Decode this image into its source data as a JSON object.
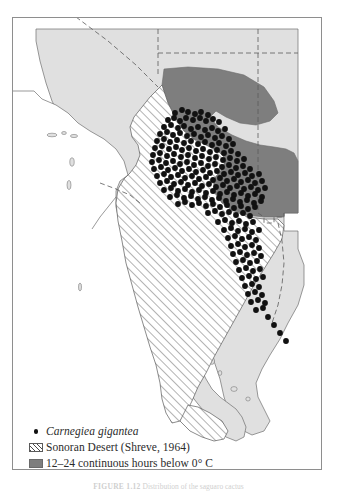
{
  "figure": {
    "caption_label": "FIGURE 1.12",
    "caption_text": "Distribution of the saguaro cactus"
  },
  "legend": {
    "items": [
      {
        "swatch": "dot-marker",
        "label": "Carnegiea gigantea",
        "style": "italic"
      },
      {
        "swatch": "hatched-box",
        "label": "Sonoran Desert (Shreve, 1964)",
        "style": "normal"
      },
      {
        "swatch": "solid-gray-box",
        "label": "12–24 continuous hours below 0° C",
        "style": "normal"
      }
    ]
  },
  "map": {
    "colors": {
      "land": "#e0e0e0",
      "land_outline": "#6f6f6f",
      "ocean": "#ffffff",
      "cold_region": "#7e7e7e",
      "cold_region_outline": "#6a6a6a",
      "hatch_line": "#4a4a4a",
      "dot": "#111111",
      "border_dashed": "#5a5a5a",
      "frame": "#8e8e8e"
    },
    "layers": [
      {
        "name": "land-mass",
        "description": "Southwestern United States and northwestern Mexico landmass including Baja California peninsula"
      },
      {
        "name": "sonoran-desert-extent",
        "description": "Diagonally hatched region after Shreve 1964"
      },
      {
        "name": "cold-hours-region",
        "description": "Solid gray region of 12-24 continuous hours below 0 degrees C"
      },
      {
        "name": "state-boundaries",
        "description": "Dashed political boundary lines"
      },
      {
        "name": "saguaro-occurrence-points",
        "description": "Black point records of Carnegiea gigantea"
      }
    ],
    "dot_radius": 2.9,
    "dot_count": 196,
    "dots": [
      [
        163,
        96
      ],
      [
        170,
        93
      ],
      [
        176,
        95
      ],
      [
        183,
        97
      ],
      [
        189,
        95
      ],
      [
        196,
        98
      ],
      [
        156,
        103
      ],
      [
        162,
        101
      ],
      [
        168,
        104
      ],
      [
        174,
        101
      ],
      [
        181,
        103
      ],
      [
        188,
        101
      ],
      [
        194,
        104
      ],
      [
        201,
        102
      ],
      [
        207,
        105
      ],
      [
        152,
        110
      ],
      [
        159,
        108
      ],
      [
        166,
        111
      ],
      [
        172,
        109
      ],
      [
        179,
        112
      ],
      [
        186,
        110
      ],
      [
        193,
        113
      ],
      [
        200,
        111
      ],
      [
        206,
        114
      ],
      [
        213,
        112
      ],
      [
        148,
        117
      ],
      [
        155,
        115
      ],
      [
        161,
        118
      ],
      [
        168,
        116
      ],
      [
        175,
        119
      ],
      [
        182,
        117
      ],
      [
        189,
        120
      ],
      [
        196,
        118
      ],
      [
        203,
        121
      ],
      [
        210,
        119
      ],
      [
        217,
        122
      ],
      [
        145,
        124
      ],
      [
        152,
        122
      ],
      [
        158,
        125
      ],
      [
        165,
        123
      ],
      [
        172,
        126
      ],
      [
        179,
        124
      ],
      [
        186,
        127
      ],
      [
        193,
        125
      ],
      [
        200,
        128
      ],
      [
        207,
        126
      ],
      [
        214,
        129
      ],
      [
        221,
        127
      ],
      [
        143,
        131
      ],
      [
        150,
        129
      ],
      [
        157,
        132
      ],
      [
        164,
        130
      ],
      [
        170,
        133
      ],
      [
        177,
        131
      ],
      [
        184,
        134
      ],
      [
        191,
        132
      ],
      [
        198,
        135
      ],
      [
        205,
        133
      ],
      [
        212,
        136
      ],
      [
        219,
        134
      ],
      [
        226,
        137
      ],
      [
        141,
        138
      ],
      [
        148,
        136
      ],
      [
        155,
        139
      ],
      [
        162,
        137
      ],
      [
        169,
        140
      ],
      [
        176,
        138
      ],
      [
        183,
        141
      ],
      [
        190,
        139
      ],
      [
        197,
        142
      ],
      [
        204,
        140
      ],
      [
        211,
        143
      ],
      [
        218,
        141
      ],
      [
        225,
        144
      ],
      [
        232,
        142
      ],
      [
        140,
        145
      ],
      [
        147,
        143
      ],
      [
        154,
        146
      ],
      [
        161,
        144
      ],
      [
        168,
        147
      ],
      [
        175,
        145
      ],
      [
        182,
        148
      ],
      [
        189,
        146
      ],
      [
        196,
        149
      ],
      [
        203,
        147
      ],
      [
        210,
        150
      ],
      [
        217,
        148
      ],
      [
        224,
        151
      ],
      [
        231,
        149
      ],
      [
        238,
        152
      ],
      [
        142,
        152
      ],
      [
        149,
        150
      ],
      [
        156,
        153
      ],
      [
        163,
        151
      ],
      [
        170,
        154
      ],
      [
        177,
        152
      ],
      [
        184,
        155
      ],
      [
        191,
        153
      ],
      [
        198,
        156
      ],
      [
        205,
        154
      ],
      [
        212,
        157
      ],
      [
        219,
        155
      ],
      [
        226,
        158
      ],
      [
        233,
        156
      ],
      [
        240,
        159
      ],
      [
        247,
        157
      ],
      [
        145,
        159
      ],
      [
        152,
        157
      ],
      [
        159,
        160
      ],
      [
        166,
        158
      ],
      [
        173,
        161
      ],
      [
        180,
        159
      ],
      [
        187,
        162
      ],
      [
        194,
        160
      ],
      [
        201,
        163
      ],
      [
        208,
        161
      ],
      [
        215,
        164
      ],
      [
        222,
        162
      ],
      [
        229,
        165
      ],
      [
        236,
        163
      ],
      [
        243,
        166
      ],
      [
        250,
        164
      ],
      [
        148,
        166
      ],
      [
        155,
        164
      ],
      [
        162,
        167
      ],
      [
        169,
        165
      ],
      [
        176,
        168
      ],
      [
        183,
        166
      ],
      [
        190,
        169
      ],
      [
        197,
        167
      ],
      [
        204,
        170
      ],
      [
        211,
        168
      ],
      [
        218,
        171
      ],
      [
        225,
        169
      ],
      [
        232,
        172
      ],
      [
        239,
        170
      ],
      [
        246,
        173
      ],
      [
        253,
        171
      ],
      [
        152,
        173
      ],
      [
        159,
        171
      ],
      [
        166,
        174
      ],
      [
        173,
        172
      ],
      [
        180,
        175
      ],
      [
        187,
        173
      ],
      [
        194,
        176
      ],
      [
        201,
        174
      ],
      [
        208,
        177
      ],
      [
        215,
        175
      ],
      [
        222,
        178
      ],
      [
        229,
        176
      ],
      [
        236,
        179
      ],
      [
        243,
        177
      ],
      [
        250,
        180
      ],
      [
        158,
        180
      ],
      [
        165,
        178
      ],
      [
        172,
        181
      ],
      [
        179,
        179
      ],
      [
        186,
        182
      ],
      [
        193,
        180
      ],
      [
        200,
        183
      ],
      [
        207,
        181
      ],
      [
        214,
        184
      ],
      [
        221,
        182
      ],
      [
        228,
        185
      ],
      [
        235,
        183
      ],
      [
        242,
        186
      ],
      [
        249,
        184
      ],
      [
        166,
        187
      ],
      [
        173,
        185
      ],
      [
        180,
        188
      ],
      [
        187,
        186
      ],
      [
        194,
        189
      ],
      [
        201,
        187
      ],
      [
        208,
        190
      ],
      [
        215,
        188
      ],
      [
        222,
        191
      ],
      [
        229,
        189
      ],
      [
        236,
        192
      ],
      [
        243,
        190
      ],
      [
        196,
        196
      ],
      [
        203,
        194
      ],
      [
        210,
        197
      ],
      [
        217,
        195
      ],
      [
        224,
        198
      ],
      [
        231,
        196
      ],
      [
        238,
        199
      ],
      [
        206,
        205
      ],
      [
        213,
        203
      ],
      [
        220,
        206
      ],
      [
        227,
        204
      ],
      [
        234,
        207
      ],
      [
        241,
        205
      ],
      [
        212,
        213
      ],
      [
        219,
        211
      ],
      [
        226,
        214
      ],
      [
        233,
        212
      ],
      [
        240,
        215
      ],
      [
        247,
        213
      ],
      [
        216,
        221
      ],
      [
        223,
        219
      ],
      [
        230,
        222
      ],
      [
        237,
        220
      ],
      [
        244,
        223
      ],
      [
        219,
        229
      ],
      [
        226,
        227
      ],
      [
        233,
        230
      ],
      [
        240,
        228
      ],
      [
        247,
        231
      ],
      [
        221,
        237
      ],
      [
        228,
        235
      ],
      [
        235,
        238
      ],
      [
        242,
        236
      ],
      [
        249,
        239
      ],
      [
        224,
        245
      ],
      [
        231,
        243
      ],
      [
        238,
        246
      ],
      [
        245,
        244
      ],
      [
        227,
        253
      ],
      [
        234,
        251
      ],
      [
        241,
        254
      ],
      [
        248,
        252
      ],
      [
        230,
        261
      ],
      [
        237,
        259
      ],
      [
        244,
        262
      ],
      [
        251,
        260
      ],
      [
        233,
        269
      ],
      [
        240,
        267
      ],
      [
        247,
        270
      ],
      [
        236,
        277
      ],
      [
        243,
        275
      ],
      [
        250,
        278
      ],
      [
        239,
        285
      ],
      [
        246,
        283
      ],
      [
        253,
        286
      ],
      [
        244,
        293
      ],
      [
        251,
        291
      ],
      [
        256,
        300
      ],
      [
        262,
        308
      ],
      [
        268,
        316
      ],
      [
        274,
        324
      ]
    ]
  }
}
